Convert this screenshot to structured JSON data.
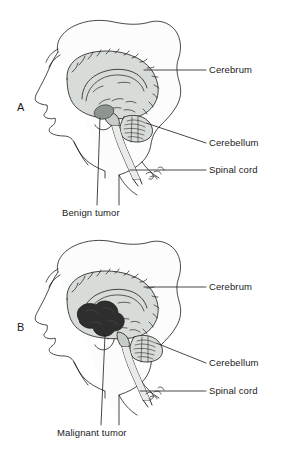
{
  "figure": {
    "type": "anatomical-illustration",
    "background_color": "#ffffff",
    "line_color": "#1a1a1a",
    "brain_fill_color": "#d8dcd8",
    "brain_shadow_color": "#b9bfb9",
    "benign_tumor_color": "#8e9490",
    "malignant_tumor_color": "#2e2e2e"
  },
  "panels": [
    {
      "letter": "A",
      "caption": "Benign tumor",
      "tumor_type": "benign",
      "tumor_description": "small smooth well-defined oval mass",
      "labels": [
        {
          "text": "Cerebrum"
        },
        {
          "text": "Cerebellum"
        },
        {
          "text": "Spinal cord"
        }
      ]
    },
    {
      "letter": "B",
      "caption": "Malignant tumor",
      "tumor_type": "malignant",
      "tumor_description": "large dark irregular lobulated invasive mass",
      "labels": [
        {
          "text": "Cerebrum"
        },
        {
          "text": "Cerebellum"
        },
        {
          "text": "Spinal cord"
        }
      ]
    }
  ]
}
